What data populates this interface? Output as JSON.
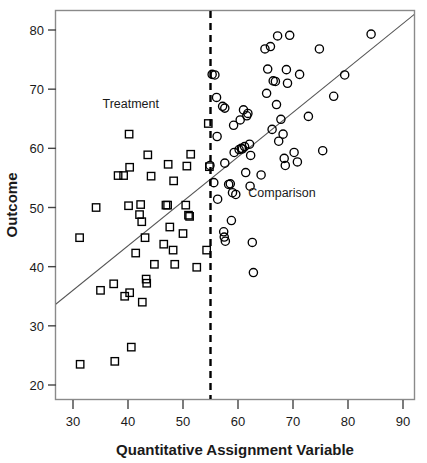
{
  "chart_data": {
    "type": "scatter",
    "title": "",
    "xlabel": "Quantitative Assignment Variable",
    "ylabel": "Outcome",
    "xlim": [
      26,
      93
    ],
    "ylim": [
      16.5,
      83
    ],
    "xticks": [
      30,
      40,
      50,
      60,
      70,
      80,
      90
    ],
    "yticks": [
      20,
      30,
      40,
      50,
      60,
      70,
      80
    ],
    "grid": false,
    "legend_position": "in-plot-annotations",
    "annotations": [
      {
        "text": "Treatment",
        "x": 40.5,
        "y": 66.8
      },
      {
        "text": "Comparison",
        "x": 68.0,
        "y": 51.8
      }
    ],
    "cutoff": {
      "label": "",
      "x": 55,
      "style": "dashed",
      "color": "#000000"
    },
    "regression_line": {
      "x": [
        26,
        92.8
      ],
      "y": [
        33.0,
        83.2
      ],
      "color": "#555555"
    },
    "series": [
      {
        "name": "Treatment",
        "marker": "square",
        "color": "#000000",
        "points": [
          [
            31.2,
            44.9
          ],
          [
            31.3,
            23.5
          ],
          [
            34.2,
            50.0
          ],
          [
            35.0,
            36.0
          ],
          [
            37.4,
            37.1
          ],
          [
            37.6,
            24.0
          ],
          [
            38.2,
            55.4
          ],
          [
            39.2,
            55.4
          ],
          [
            39.4,
            35.0
          ],
          [
            40.1,
            50.3
          ],
          [
            40.2,
            62.4
          ],
          [
            40.3,
            56.8
          ],
          [
            40.3,
            35.6
          ],
          [
            40.6,
            26.4
          ],
          [
            41.4,
            42.3
          ],
          [
            42.1,
            48.8
          ],
          [
            42.3,
            50.5
          ],
          [
            42.5,
            47.6
          ],
          [
            42.6,
            34.0
          ],
          [
            43.1,
            44.9
          ],
          [
            43.3,
            37.9
          ],
          [
            43.4,
            37.2
          ],
          [
            43.6,
            58.9
          ],
          [
            44.2,
            55.3
          ],
          [
            44.8,
            40.4
          ],
          [
            46.5,
            43.8
          ],
          [
            46.9,
            50.4
          ],
          [
            47.2,
            50.4
          ],
          [
            47.3,
            57.3
          ],
          [
            47.6,
            46.7
          ],
          [
            48.2,
            42.8
          ],
          [
            48.3,
            54.5
          ],
          [
            48.5,
            40.4
          ],
          [
            50.0,
            45.6
          ],
          [
            50.5,
            50.4
          ],
          [
            50.7,
            57.0
          ],
          [
            51.0,
            48.7
          ],
          [
            51.2,
            48.5
          ],
          [
            51.4,
            59.0
          ],
          [
            52.5,
            39.9
          ],
          [
            54.3,
            42.8
          ],
          [
            54.6,
            64.2
          ],
          [
            54.8,
            56.9
          ]
        ]
      },
      {
        "name": "Comparison",
        "marker": "circle",
        "color": "#000000",
        "points": [
          [
            54.9,
            57.1
          ],
          [
            55.3,
            72.5
          ],
          [
            55.8,
            72.4
          ],
          [
            55.6,
            54.2
          ],
          [
            56.1,
            68.6
          ],
          [
            56.2,
            62.0
          ],
          [
            56.3,
            51.4
          ],
          [
            57.2,
            67.1
          ],
          [
            57.6,
            66.8
          ],
          [
            57.4,
            45.9
          ],
          [
            57.5,
            45.0
          ],
          [
            57.7,
            44.3
          ],
          [
            57.6,
            57.5
          ],
          [
            58.3,
            53.9
          ],
          [
            58.6,
            54.0
          ],
          [
            58.8,
            47.8
          ],
          [
            59.0,
            52.5
          ],
          [
            59.2,
            63.9
          ],
          [
            59.3,
            59.3
          ],
          [
            59.6,
            52.2
          ],
          [
            60.2,
            59.8
          ],
          [
            60.4,
            64.8
          ],
          [
            60.6,
            60.0
          ],
          [
            60.8,
            59.9
          ],
          [
            61.0,
            66.5
          ],
          [
            61.2,
            60.3
          ],
          [
            61.4,
            55.9
          ],
          [
            61.6,
            65.5
          ],
          [
            61.8,
            65.9
          ],
          [
            62.1,
            60.7
          ],
          [
            62.2,
            53.6
          ],
          [
            62.3,
            58.8
          ],
          [
            62.6,
            44.1
          ],
          [
            62.8,
            39.0
          ],
          [
            64.2,
            55.5
          ],
          [
            64.9,
            76.8
          ],
          [
            65.2,
            69.3
          ],
          [
            65.4,
            73.4
          ],
          [
            65.9,
            77.2
          ],
          [
            66.2,
            63.2
          ],
          [
            66.4,
            71.4
          ],
          [
            66.8,
            71.3
          ],
          [
            67.0,
            67.4
          ],
          [
            67.2,
            79.0
          ],
          [
            67.4,
            61.2
          ],
          [
            67.8,
            64.9
          ],
          [
            68.2,
            62.4
          ],
          [
            68.4,
            58.3
          ],
          [
            68.6,
            57.1
          ],
          [
            68.8,
            73.3
          ],
          [
            69.0,
            71.0
          ],
          [
            69.4,
            79.1
          ],
          [
            70.2,
            59.3
          ],
          [
            70.8,
            57.7
          ],
          [
            71.2,
            72.5
          ],
          [
            72.8,
            65.4
          ],
          [
            74.8,
            76.8
          ],
          [
            75.4,
            59.6
          ],
          [
            77.4,
            68.8
          ],
          [
            79.4,
            72.4
          ],
          [
            84.2,
            79.3
          ]
        ]
      }
    ]
  }
}
